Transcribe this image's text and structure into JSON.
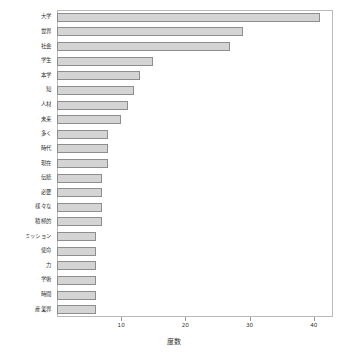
{
  "chart_data": {
    "type": "bar",
    "orientation": "horizontal",
    "title": "",
    "xlabel": "度数",
    "ylabel": "",
    "xlim": [
      0,
      43
    ],
    "xticks": [
      10,
      20,
      30,
      40
    ],
    "grid": false,
    "legend": null,
    "bar_fill_color": "#d4d4d4",
    "bar_border_color": "#8e8e8e",
    "frame_color": "#b9b9b9",
    "categories": [
      "大学",
      "世界",
      "社会",
      "学生",
      "本学",
      "知",
      "人材",
      "未来",
      "多く",
      "時代",
      "現在",
      "伝統",
      "必要",
      "様々な",
      "積極的",
      "ミッション",
      "使命",
      "力",
      "学術",
      "時間",
      "産業界"
    ],
    "values": [
      41,
      29,
      27,
      15,
      13,
      12,
      11,
      10,
      8,
      8,
      8,
      7,
      7,
      7,
      7,
      6,
      6,
      6,
      6,
      6,
      6
    ]
  }
}
